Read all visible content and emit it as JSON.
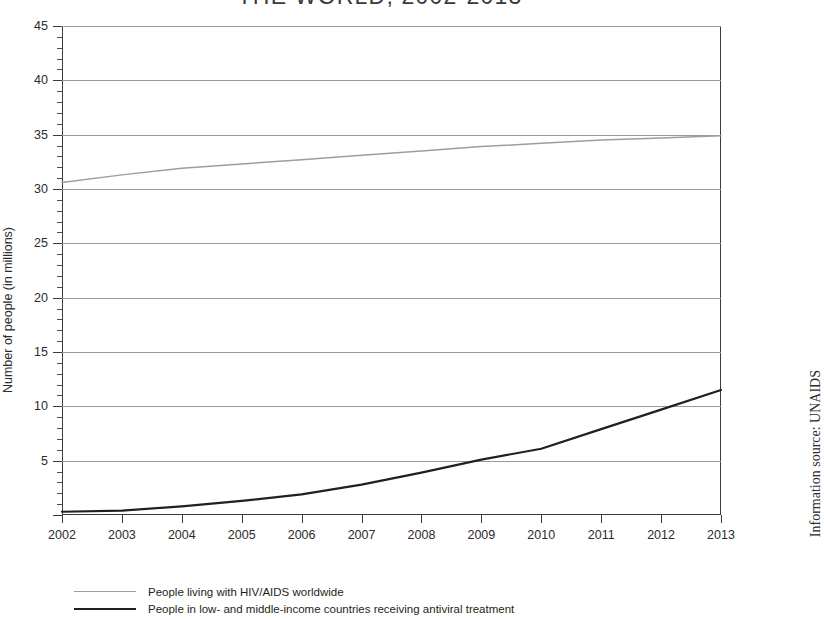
{
  "title": "THE WORLD, 2002-2013",
  "source_note": "Information source: UNAIDS",
  "chart_data": {
    "type": "line",
    "title": "THE WORLD, 2002-2013",
    "xlabel": "",
    "ylabel": "Number of people (in millions)",
    "xlim": [
      2002,
      2013
    ],
    "ylim": [
      0,
      45
    ],
    "y_ticks": [
      0,
      5,
      10,
      15,
      20,
      25,
      30,
      35,
      40,
      45
    ],
    "y_minor_tick_step": 1,
    "grid": true,
    "legend_position": "below-left",
    "x": [
      2002,
      2003,
      2004,
      2005,
      2006,
      2007,
      2008,
      2009,
      2010,
      2011,
      2012,
      2013
    ],
    "categories": [
      "2002",
      "2003",
      "2004",
      "2005",
      "2006",
      "2007",
      "2008",
      "2009",
      "2010",
      "2011",
      "2012",
      "2013"
    ],
    "series": [
      {
        "name": "People living with HIV/AIDS worldwide",
        "color": "#9d9d9f",
        "values": [
          30.6,
          31.3,
          31.9,
          32.3,
          32.7,
          33.1,
          33.5,
          33.9,
          34.2,
          34.5,
          34.7,
          34.9
        ]
      },
      {
        "name": "People in low- and middle-income countries receiving antiviral treatment",
        "color": "#231f20",
        "values": [
          0.3,
          0.4,
          0.8,
          1.3,
          1.9,
          2.8,
          3.9,
          5.1,
          6.1,
          7.9,
          9.7,
          11.5
        ]
      }
    ]
  },
  "axes": {
    "y_title": "Number of people (in millions)",
    "y_labels": [
      "45",
      "40",
      "35",
      "30",
      "25",
      "20",
      "15",
      "10",
      "5"
    ],
    "x_labels": [
      "2002",
      "2003",
      "2004",
      "2005",
      "2006",
      "2007",
      "2008",
      "2009",
      "2010",
      "2011",
      "2012",
      "2013"
    ]
  },
  "legend": {
    "items": [
      {
        "label": "People living with HIV/AIDS worldwide",
        "color": "#9d9d9f"
      },
      {
        "label": "People in low- and middle-income countries receiving antiviral treatment",
        "color": "#231f20"
      }
    ]
  }
}
